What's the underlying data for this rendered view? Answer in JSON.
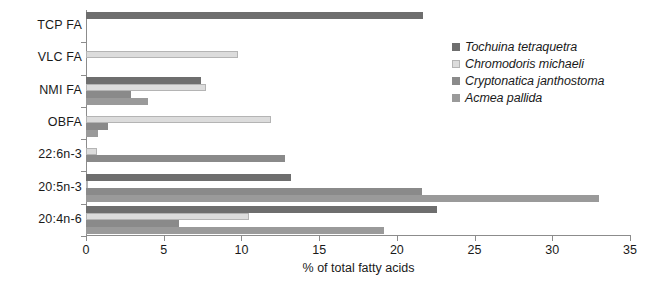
{
  "chart_data": {
    "type": "bar",
    "orientation": "horizontal",
    "title": "",
    "xlabel": "% of total fatty acids",
    "ylabel": "",
    "xlim": [
      0,
      35
    ],
    "xticks": [
      "0",
      "5",
      "10",
      "15",
      "20",
      "25",
      "30",
      "35"
    ],
    "grid": false,
    "legend_position": "right",
    "categories": [
      "TCP FA",
      "VLC FA",
      "NMI FA",
      "OBFA",
      "22:6n-3",
      "20:5n-3",
      "20:4n-6"
    ],
    "series": [
      {
        "name": "Tochuina tetraquetra",
        "color": "#6e6e6e",
        "values": [
          21.7,
          0.0,
          7.4,
          0.0,
          0.0,
          13.2,
          22.6
        ]
      },
      {
        "name": "Chromodoris michaeli",
        "color": "#dcdcdc",
        "values": [
          0.0,
          9.8,
          7.7,
          11.9,
          0.7,
          0.1,
          10.5
        ]
      },
      {
        "name": "Cryptonatica janthostoma",
        "color": "#8a8a8a",
        "values": [
          0.0,
          0.0,
          2.9,
          1.4,
          12.8,
          21.6,
          6.0
        ]
      },
      {
        "name": "Acmea pallida",
        "color": "#9a9a9a",
        "values": [
          0.0,
          0.0,
          4.0,
          0.8,
          0.0,
          33.0,
          19.2
        ]
      }
    ]
  }
}
